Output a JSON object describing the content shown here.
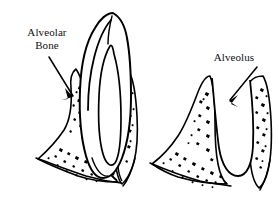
{
  "figure": {
    "style": "black-and-white line art",
    "background_color": "#ffffff",
    "ink_color": "#000000",
    "text_color": "#111111"
  },
  "labels": {
    "alveolar_bone": {
      "line1": "Alveolar",
      "line2": "Bone",
      "leader": "arrow pointing down-right to crest of alveolar bone"
    },
    "alveolus": {
      "text": "Alveolus",
      "leader": "arrow pointing down-left into empty socket"
    }
  },
  "panels": [
    {
      "name": "tooth-in-socket",
      "position": "left",
      "parts": [
        "tooth crown",
        "tooth root",
        "pulp chamber",
        "root canal",
        "alveolar bone",
        "trabecular bone stipple",
        "gingival contour"
      ]
    },
    {
      "name": "empty-alveolus",
      "position": "right",
      "parts": [
        "alveolus socket",
        "alveolar bone crest",
        "trabecular bone stipple",
        "bone contour"
      ]
    }
  ]
}
